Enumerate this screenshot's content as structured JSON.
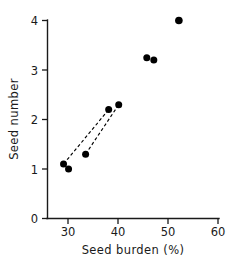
{
  "chart_data": {
    "type": "scatter",
    "title": "",
    "xlabel": "Seed burden (%)",
    "ylabel": "Seed number",
    "xlim": [
      25.8,
      60
    ],
    "ylim": [
      0,
      4
    ],
    "xticks": [
      30,
      40,
      50,
      60
    ],
    "xtick_labels": [
      "30",
      "40",
      "50",
      "60"
    ],
    "yticks": [
      0,
      1,
      2,
      3,
      4
    ],
    "ytick_labels": [
      "0",
      "1",
      "2",
      "3",
      "4"
    ],
    "grid": false,
    "legend": null,
    "marker": "filled-circle",
    "marker_color": "#000000",
    "points": [
      {
        "x": 29.0,
        "y": 1.1
      },
      {
        "x": 30.0,
        "y": 1.0
      },
      {
        "x": 33.4,
        "y": 1.3
      },
      {
        "x": 38.0,
        "y": 2.2
      },
      {
        "x": 40.0,
        "y": 2.3
      },
      {
        "x": 45.6,
        "y": 3.25
      },
      {
        "x": 47.0,
        "y": 3.2
      },
      {
        "x": 52.0,
        "y": 4.0
      }
    ],
    "connectors": [
      {
        "from": {
          "x": 29.0,
          "y": 1.1
        },
        "to": {
          "x": 38.0,
          "y": 2.2
        },
        "style": "dashed"
      },
      {
        "from": {
          "x": 33.4,
          "y": 1.3
        },
        "to": {
          "x": 40.0,
          "y": 2.3
        },
        "style": "dashed"
      }
    ]
  },
  "axes": {
    "x_axis_label": "Seed burden (%)",
    "y_axis_label": "Seed number"
  }
}
